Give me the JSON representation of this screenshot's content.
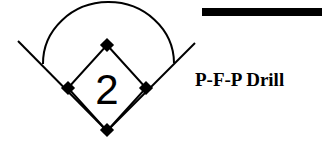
{
  "diagram": {
    "title": "P-F-P Drill",
    "position_number": "2",
    "colors": {
      "stroke": "#000000",
      "background": "#ffffff"
    },
    "elements": [
      "foul-line-left",
      "foul-line-right",
      "outfield-arc",
      "infield-diamond",
      "home-plate",
      "first-base",
      "second-base",
      "third-base",
      "header-bar"
    ]
  }
}
